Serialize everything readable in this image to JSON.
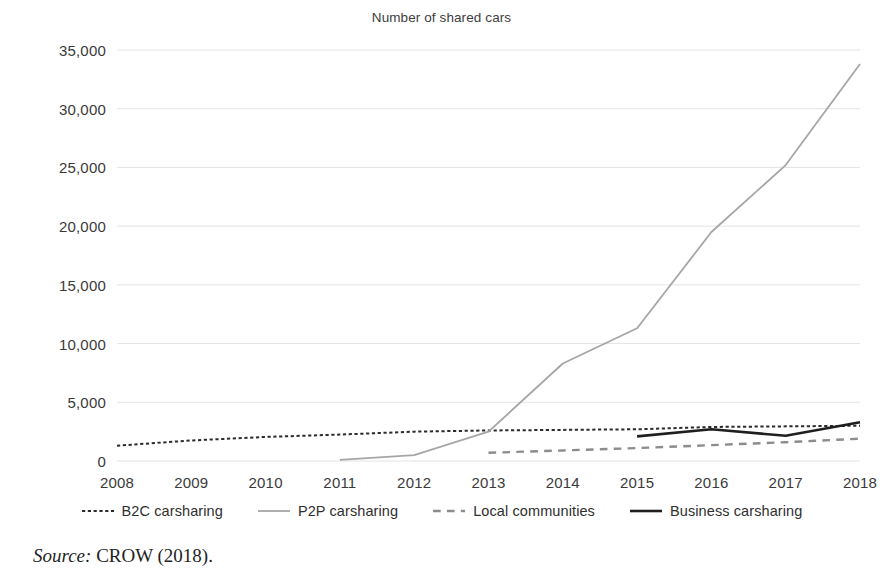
{
  "chart_data": {
    "type": "line",
    "title": "Number of shared cars",
    "xlabel": "",
    "ylabel": "",
    "x": [
      2008,
      2009,
      2010,
      2011,
      2012,
      2013,
      2014,
      2015,
      2016,
      2017,
      2018
    ],
    "categories": [
      "2008",
      "2009",
      "2010",
      "2011",
      "2012",
      "2013",
      "2014",
      "2015",
      "2016",
      "2017",
      "2018"
    ],
    "ylim": [
      0,
      35000
    ],
    "yticks": [
      0,
      5000,
      10000,
      15000,
      20000,
      25000,
      30000,
      35000
    ],
    "ytick_labels": [
      "0",
      "5,000",
      "10,000",
      "15,000",
      "20,000",
      "25,000",
      "30,000",
      "35,000"
    ],
    "grid": true,
    "grid_axis": "y",
    "legend_position": "bottom",
    "series": [
      {
        "name": "B2C carsharing",
        "style": "dotted",
        "color": "#2b2b2b",
        "width": 2,
        "x": [
          2008,
          2009,
          2010,
          2011,
          2012,
          2013,
          2014,
          2015,
          2016,
          2017,
          2018
        ],
        "values": [
          1300,
          1750,
          2050,
          2250,
          2500,
          2600,
          2650,
          2700,
          2900,
          2950,
          3000
        ]
      },
      {
        "name": "P2P carsharing",
        "style": "solid",
        "color": "#a6a6a6",
        "width": 1.8,
        "x": [
          2011,
          2012,
          2013,
          2014,
          2015,
          2016,
          2017,
          2018
        ],
        "values": [
          100,
          500,
          2500,
          8300,
          11300,
          19500,
          25200,
          33800
        ]
      },
      {
        "name": "Local communities",
        "style": "dashed",
        "color": "#8c8c8c",
        "width": 2.4,
        "x": [
          2013,
          2014,
          2015,
          2016,
          2017,
          2018
        ],
        "values": [
          700,
          900,
          1100,
          1350,
          1600,
          1900
        ]
      },
      {
        "name": "Business carsharing",
        "style": "solid",
        "color": "#1f1f1f",
        "width": 2.6,
        "x": [
          2015,
          2016,
          2017,
          2018
        ],
        "values": [
          2100,
          2700,
          2150,
          3300
        ]
      }
    ]
  },
  "legend": {
    "items": [
      {
        "label": "B2C carsharing",
        "marker": "dotted-dark-line-icon"
      },
      {
        "label": "P2P carsharing",
        "marker": "solid-light-line-icon"
      },
      {
        "label": "Local communities",
        "marker": "dashed-gray-line-icon"
      },
      {
        "label": "Business carsharing",
        "marker": "solid-dark-line-icon"
      }
    ]
  },
  "source": {
    "label": "Source:",
    "text": "CROW (2018)."
  },
  "colors": {
    "b2c": "#2b2b2b",
    "p2p": "#a6a6a6",
    "local": "#8c8c8c",
    "business": "#1f1f1f",
    "grid": "#e4e4e4",
    "text": "#3a3a3a"
  }
}
